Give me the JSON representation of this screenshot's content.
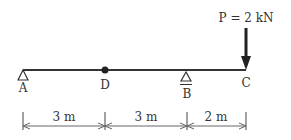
{
  "diagram": {
    "type": "beam",
    "load": {
      "label": "P = 2 kN",
      "point": "C",
      "direction": "down"
    },
    "points": [
      {
        "id": "A",
        "label": "A",
        "kind": "pin-support"
      },
      {
        "id": "D",
        "label": "D",
        "kind": "hinge"
      },
      {
        "id": "B",
        "label": "B",
        "kind": "roller-support"
      },
      {
        "id": "C",
        "label": "C",
        "kind": "free-end"
      }
    ],
    "dimensions": [
      {
        "from": "A",
        "to": "D",
        "label": "3 m"
      },
      {
        "from": "D",
        "to": "B",
        "label": "3 m"
      },
      {
        "from": "B",
        "to": "C",
        "label": "2 m"
      }
    ]
  }
}
